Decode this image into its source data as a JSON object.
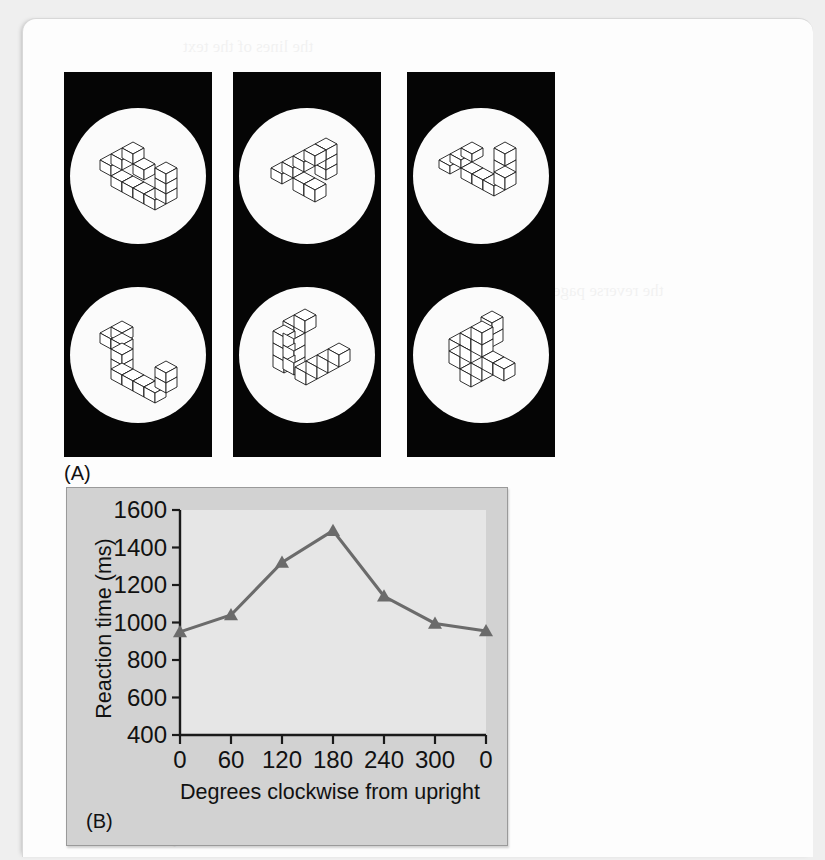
{
  "figure": {
    "panel_a": {
      "label": "(A)",
      "panels": [
        {
          "name": "stimulus-pair-1",
          "top_disc": "3d-block-figure-upright",
          "bottom_disc": "3d-block-figure-rotated"
        },
        {
          "name": "stimulus-pair-2",
          "top_disc": "3d-block-figure-upright",
          "bottom_disc": "3d-block-figure-rotated"
        },
        {
          "name": "stimulus-pair-3",
          "top_disc": "3d-block-figure-upright",
          "bottom_disc": "3d-block-figure-rotated"
        }
      ]
    },
    "panel_b": {
      "label": "(B)"
    }
  },
  "chart_data": {
    "type": "line",
    "title": "",
    "xlabel": "Degrees clockwise from upright",
    "ylabel": "Reaction time (ms)",
    "x": [
      0,
      60,
      120,
      180,
      240,
      300,
      360
    ],
    "xtick_labels": [
      "0",
      "60",
      "120",
      "180",
      "240",
      "300",
      "0"
    ],
    "ytick_labels": [
      "400",
      "600",
      "800",
      "1000",
      "1200",
      "1400",
      "1600"
    ],
    "yticks": [
      400,
      600,
      800,
      1000,
      1200,
      1400,
      1600
    ],
    "values": [
      950,
      1040,
      1320,
      1490,
      1140,
      995,
      955
    ],
    "xlim": [
      0,
      360
    ],
    "ylim": [
      400,
      1600
    ],
    "grid": false,
    "legend": null,
    "marker": "triangle",
    "line_color": "#6b6b6b",
    "plot_bg": "#e6e6e6",
    "panel_bg": "#d2d2d2"
  }
}
